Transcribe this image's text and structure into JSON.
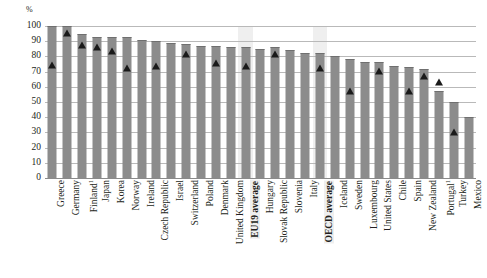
{
  "chart_data": {
    "type": "bar",
    "title": "",
    "xlabel": "",
    "ylabel": "%",
    "ylim": [
      0,
      100
    ],
    "ytick_values": [
      0,
      10,
      20,
      30,
      40,
      50,
      60,
      70,
      80,
      90,
      100
    ],
    "ytick_labels": [
      "0",
      "10",
      "20",
      "30",
      "40",
      "50",
      "60",
      "70",
      "80",
      "90",
      "100"
    ],
    "grid": true,
    "legend": "none",
    "categories": [
      "Greece",
      "Germany",
      "Finland",
      "Japan",
      "Korea",
      "Norway",
      "Ireland",
      "Czech Republic",
      "Israel",
      "Switzerland",
      "Poland",
      "Denmark",
      "United Kingdom",
      "EU19 average",
      "Hungary",
      "Slovak Republic",
      "Slovenia",
      "Italy",
      "OECD average",
      "Iceland",
      "Sweden",
      "Luxembourg",
      "United States",
      "Chile",
      "Spain",
      "New Zealand",
      "Portugal",
      "Turkey",
      "Mexico"
    ],
    "category_labels": [
      "Greece",
      "Germany",
      "Finland¹",
      "Japan",
      "Korea",
      "Norway",
      "Ireland",
      "Czech Republic",
      "Israel",
      "Switzerland",
      "Poland",
      "Denmark",
      "United Kingdom",
      "EU19 average",
      "Hungary",
      "Slovak Republic",
      "Slovenia",
      "Italy",
      "OECD average",
      "Iceland",
      "Sweden",
      "Luxembourg",
      "United States",
      "Chile",
      "Spain",
      "New Zealand",
      "Portugal¹",
      "Turkey",
      "Mexico"
    ],
    "footnote_markers": {
      "Finland": "1",
      "Portugal": "1"
    },
    "highlighted_categories": [
      "EU19 average",
      "OECD average"
    ],
    "bold_categories": [
      "EU19 average",
      "OECD average"
    ],
    "series": [
      {
        "name": "bars",
        "type": "bar",
        "color": "#8c8c8c",
        "values": [
          100,
          100,
          95,
          93,
          93,
          93,
          91,
          90,
          89,
          88,
          87,
          87,
          86,
          86,
          85,
          86,
          84,
          82,
          82,
          80,
          78,
          76,
          76,
          74,
          73,
          72,
          57,
          50,
          40
        ]
      },
      {
        "name": "markers",
        "type": "scatter",
        "marker": "triangle",
        "color": "#1a1a1a",
        "values": [
          79,
          100,
          92,
          91,
          88,
          77,
          null,
          78,
          null,
          86,
          null,
          80,
          null,
          78,
          null,
          86,
          null,
          null,
          77,
          null,
          62,
          null,
          75,
          null,
          62,
          72,
          68,
          35,
          null
        ]
      }
    ],
    "axis_unit": "%"
  },
  "axis": {
    "unit_label": "%"
  }
}
